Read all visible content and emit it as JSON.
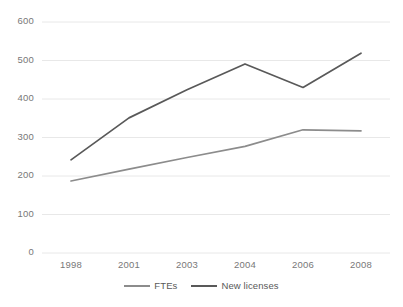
{
  "chart_data": {
    "type": "line",
    "title": "",
    "subtitle": "",
    "xlabel": "",
    "ylabel": "",
    "categories": [
      "1998",
      "2001",
      "2003",
      "2004",
      "2006",
      "2008"
    ],
    "ylim": [
      0,
      600
    ],
    "yticks": [
      0,
      100,
      200,
      300,
      400,
      500,
      600
    ],
    "ytick_labels": [
      "0",
      "100",
      "200",
      "300",
      "400",
      "500",
      "600"
    ],
    "grid": true,
    "grid_axis": "y",
    "legend_position": "bottom",
    "series": [
      {
        "name": "FTEs",
        "color": "#8c8c8c",
        "values": [
          187,
          218,
          248,
          277,
          320,
          317
        ]
      },
      {
        "name": "New licenses",
        "color": "#595959",
        "values": [
          242,
          351,
          424,
          491,
          430,
          519
        ]
      }
    ]
  },
  "legend": {
    "items": [
      {
        "label": "FTEs",
        "color": "#8c8c8c",
        "swatch": "line-swatch"
      },
      {
        "label": "New licenses",
        "color": "#595959",
        "swatch": "line-swatch"
      }
    ]
  },
  "axes": {
    "y_axis_name": "value-axis",
    "x_axis_name": "category-axis"
  }
}
